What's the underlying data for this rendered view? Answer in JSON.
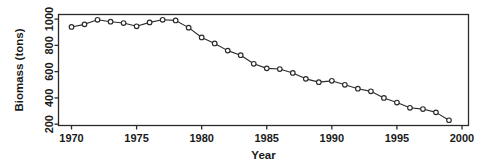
{
  "figure": {
    "background_color": "#ffffff",
    "foreground_color": "#2b2b2b"
  },
  "chart_data": {
    "type": "line",
    "title": "",
    "xlabel": "Year",
    "ylabel": "Biomass (tons)",
    "xlim": [
      1969,
      2000.5
    ],
    "ylim": [
      190,
      1035
    ],
    "grid": false,
    "legend": null,
    "marker": "open-circle",
    "x_ticks": [
      1970,
      1975,
      1980,
      1985,
      1990,
      1995,
      2000
    ],
    "x_tick_labels": [
      "1970",
      "1975",
      "1980",
      "1985",
      "1990",
      "1995",
      "2000"
    ],
    "y_ticks": [
      200,
      400,
      600,
      800,
      1000
    ],
    "y_tick_labels": [
      "200",
      "400",
      "600",
      "800",
      "1000"
    ],
    "x": [
      1970,
      1971,
      1972,
      1973,
      1974,
      1975,
      1976,
      1977,
      1978,
      1979,
      1980,
      1981,
      1982,
      1983,
      1984,
      1985,
      1986,
      1987,
      1988,
      1989,
      1990,
      1991,
      1992,
      1993,
      1994,
      1995,
      1996,
      1997,
      1998,
      1999
    ],
    "values": [
      940,
      960,
      995,
      980,
      970,
      945,
      975,
      995,
      990,
      935,
      860,
      815,
      760,
      725,
      660,
      625,
      620,
      590,
      545,
      520,
      530,
      500,
      470,
      450,
      400,
      365,
      325,
      315,
      290,
      230
    ],
    "series": [
      {
        "name": "Biomass",
        "values": [
          940,
          960,
          995,
          980,
          970,
          945,
          975,
          995,
          990,
          935,
          860,
          815,
          760,
          725,
          660,
          625,
          620,
          590,
          545,
          520,
          530,
          500,
          470,
          450,
          400,
          365,
          325,
          315,
          290,
          230
        ]
      }
    ]
  }
}
